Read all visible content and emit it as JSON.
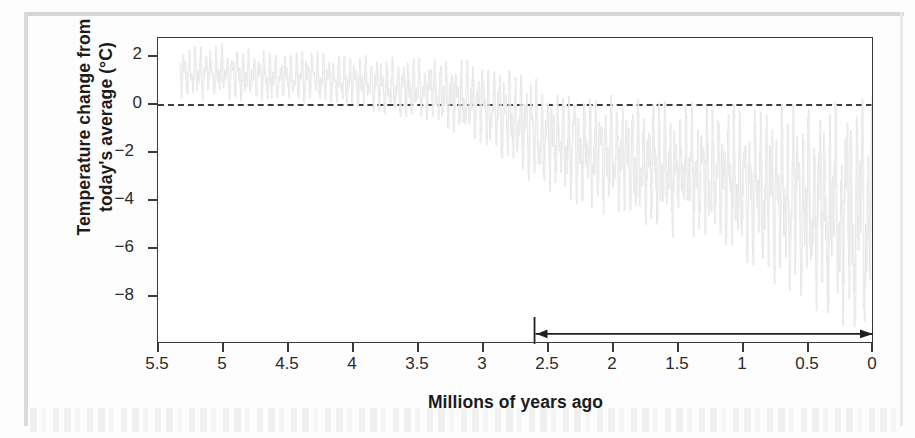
{
  "figure": {
    "xlabel": "Millions of years ago",
    "ylabel_line1": "Temperature change from",
    "ylabel_line2": "today's average (°C)"
  },
  "axes": {
    "y_ticks": [
      "2",
      "0",
      "−2",
      "−4",
      "−6",
      "−8"
    ],
    "x_ticks": [
      "5.5",
      "5",
      "4.5",
      "4",
      "3.5",
      "3",
      "2.5",
      "2",
      "1.5",
      "1",
      "0.5",
      "0"
    ]
  },
  "colors": {
    "series": "#e2e2e2",
    "axis": "#3a3a3a",
    "zero_line": "#3d3d3d",
    "annotation": "#1f1f1f",
    "text": "#1b1b1b",
    "page_frame": "#d8dade",
    "background": "#ffffff"
  },
  "annotation": {
    "type": "double-headed-arrow",
    "x_start": 2.6,
    "x_end": 0.0,
    "y": -8.85,
    "label": ""
  },
  "chart_data": {
    "type": "line",
    "title": "",
    "xlabel": "Millions of years ago",
    "ylabel": "Temperature change from today's average (°C)",
    "xlim": [
      5.5,
      0
    ],
    "ylim": [
      -9.2,
      2.6
    ],
    "x_inverted": true,
    "grid": false,
    "legend": null,
    "zero_reference_line": 0,
    "series": [
      {
        "name": "Temperature change from today's average",
        "x_unit": "Ma",
        "y_unit": "°C",
        "description": "High-resolution benthic stack; dense oscillation band whose mean drifts downward and whose amplitude grows through the Plio-Pleistocene",
        "envelope": [
          {
            "x": 5.35,
            "mean": 1.25,
            "min": 0.3,
            "max": 2.35
          },
          {
            "x": 5.2,
            "mean": 1.2,
            "min": 0.2,
            "max": 2.3
          },
          {
            "x": 5.0,
            "mean": 1.25,
            "min": 0.25,
            "max": 2.4
          },
          {
            "x": 4.8,
            "mean": 1.15,
            "min": 0.1,
            "max": 2.2
          },
          {
            "x": 4.6,
            "mean": 1.05,
            "min": 0.05,
            "max": 2.1
          },
          {
            "x": 4.4,
            "mean": 1.1,
            "min": 0.1,
            "max": 2.15
          },
          {
            "x": 4.2,
            "mean": 1.05,
            "min": 0.0,
            "max": 2.05
          },
          {
            "x": 4.0,
            "mean": 0.95,
            "min": -0.15,
            "max": 2.0
          },
          {
            "x": 3.8,
            "mean": 0.85,
            "min": -0.35,
            "max": 1.95
          },
          {
            "x": 3.6,
            "mean": 0.8,
            "min": -0.6,
            "max": 1.9
          },
          {
            "x": 3.4,
            "mean": 0.75,
            "min": -0.7,
            "max": 1.85
          },
          {
            "x": 3.2,
            "mean": 0.6,
            "min": -1.1,
            "max": 1.8
          },
          {
            "x": 3.0,
            "mean": 0.4,
            "min": -1.6,
            "max": 1.7
          },
          {
            "x": 2.8,
            "mean": 0.05,
            "min": -2.3,
            "max": 1.4
          },
          {
            "x": 2.6,
            "mean": -0.45,
            "min": -3.1,
            "max": 1.1
          },
          {
            "x": 2.4,
            "mean": -0.85,
            "min": -3.6,
            "max": 0.7
          },
          {
            "x": 2.2,
            "mean": -1.1,
            "min": -4.0,
            "max": 0.5
          },
          {
            "x": 2.0,
            "mean": -1.3,
            "min": -4.4,
            "max": 0.4
          },
          {
            "x": 1.8,
            "mean": -1.45,
            "min": -4.7,
            "max": 0.3
          },
          {
            "x": 1.6,
            "mean": -1.6,
            "min": -5.0,
            "max": 0.2
          },
          {
            "x": 1.4,
            "mean": -1.75,
            "min": -5.3,
            "max": 0.15
          },
          {
            "x": 1.2,
            "mean": -1.9,
            "min": -5.6,
            "max": 0.1
          },
          {
            "x": 1.0,
            "mean": -2.1,
            "min": -6.1,
            "max": 0.05
          },
          {
            "x": 0.8,
            "mean": -2.35,
            "min": -6.8,
            "max": 0.05
          },
          {
            "x": 0.6,
            "mean": -2.6,
            "min": -7.4,
            "max": 0.1
          },
          {
            "x": 0.4,
            "mean": -2.8,
            "min": -8.2,
            "max": 0.15
          },
          {
            "x": 0.2,
            "mean": -2.95,
            "min": -8.6,
            "max": 0.2
          },
          {
            "x": 0.05,
            "mean": -2.7,
            "min": -8.4,
            "max": 0.3
          },
          {
            "x": 0.0,
            "mean": -1.2,
            "min": -5.0,
            "max": 0.4
          }
        ],
        "notes": [
          "Early Pliocene (5.3-4.0 Ma) values sit mostly between 0 and +2 °C",
          "Amplitude and downward drift increase sharply after ~3 Ma",
          "Late Pleistocene glacial minima reach approximately -8 to -9 °C",
          "Interglacial maxima remain near 0 °C through the Pleistocene"
        ]
      }
    ]
  }
}
